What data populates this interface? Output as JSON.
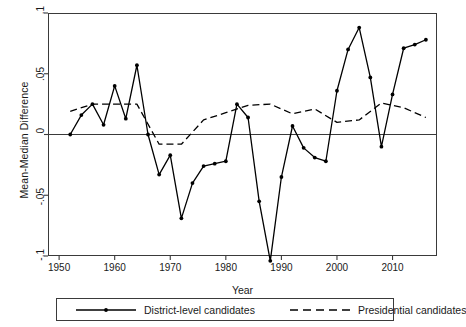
{
  "chart_data": {
    "type": "line",
    "title": "",
    "xlabel": "Year",
    "ylabel": "Mean-Median Difference",
    "xlim": [
      1948,
      2018
    ],
    "ylim": [
      -0.1,
      0.1
    ],
    "grid": false,
    "legend_position": "bottom",
    "x_ticks": [
      1950,
      1960,
      1970,
      1980,
      1990,
      2000,
      2010
    ],
    "x_tick_labels": [
      "1950",
      "1960",
      "1970",
      "1980",
      "1990",
      "2000",
      "2010"
    ],
    "y_ticks": [
      0.1,
      0.05,
      0,
      -0.05,
      -0.1
    ],
    "y_tick_labels": [
      ".1",
      ".05",
      "0",
      "-.05",
      "-.1"
    ],
    "zero_line": 0,
    "series": [
      {
        "name": "District-level candidates",
        "style": "solid",
        "marker": "circle",
        "color": "#000000",
        "x": [
          1952,
          1954,
          1956,
          1958,
          1960,
          1962,
          1964,
          1966,
          1968,
          1970,
          1972,
          1974,
          1976,
          1978,
          1980,
          1982,
          1984,
          1986,
          1988,
          1990,
          1992,
          1994,
          1996,
          1998,
          2000,
          2002,
          2004,
          2006,
          2008,
          2010,
          2012,
          2014,
          2016
        ],
        "values": [
          0.0,
          0.016,
          0.025,
          0.008,
          0.04,
          0.013,
          0.057,
          0.0,
          -0.033,
          -0.017,
          -0.069,
          -0.04,
          -0.026,
          -0.024,
          -0.022,
          0.025,
          0.014,
          -0.055,
          -0.104,
          -0.035,
          0.007,
          -0.011,
          -0.019,
          -0.022,
          0.036,
          0.07,
          0.088,
          0.047,
          -0.01,
          0.033,
          0.071,
          0.074,
          0.078
        ]
      },
      {
        "name": "Presidential candidates",
        "style": "dashed",
        "marker": "none",
        "color": "#000000",
        "x": [
          1952,
          1956,
          1960,
          1964,
          1968,
          1972,
          1976,
          1980,
          1984,
          1988,
          1992,
          1996,
          2000,
          2004,
          2008,
          2012,
          2016
        ],
        "values": [
          0.019,
          0.025,
          0.025,
          0.025,
          -0.008,
          -0.008,
          0.012,
          0.018,
          0.024,
          0.025,
          0.017,
          0.021,
          0.01,
          0.012,
          0.026,
          0.022,
          0.014
        ]
      }
    ]
  },
  "axes": {
    "y_title": "Mean-Median Difference",
    "x_title": "Year"
  },
  "legend": {
    "items": [
      {
        "label": "District-level candidates",
        "style": "solid"
      },
      {
        "label": "Presidential candidates",
        "style": "dashed"
      }
    ]
  }
}
